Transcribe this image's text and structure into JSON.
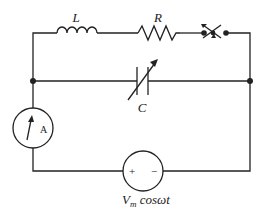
{
  "diagram": {
    "type": "circuit",
    "components": {
      "inductor": {
        "label": "L"
      },
      "resistor": {
        "label": "R"
      },
      "switch": {
        "label": ""
      },
      "capacitor": {
        "label": "C",
        "variable": true
      },
      "ammeter": {
        "label": "A"
      },
      "source": {
        "label_main": "V",
        "label_sub": "m",
        "label_expr": " cosωt",
        "plus": "+",
        "minus": "−"
      }
    },
    "colors": {
      "line": "#222222",
      "background": "#ffffff"
    }
  }
}
